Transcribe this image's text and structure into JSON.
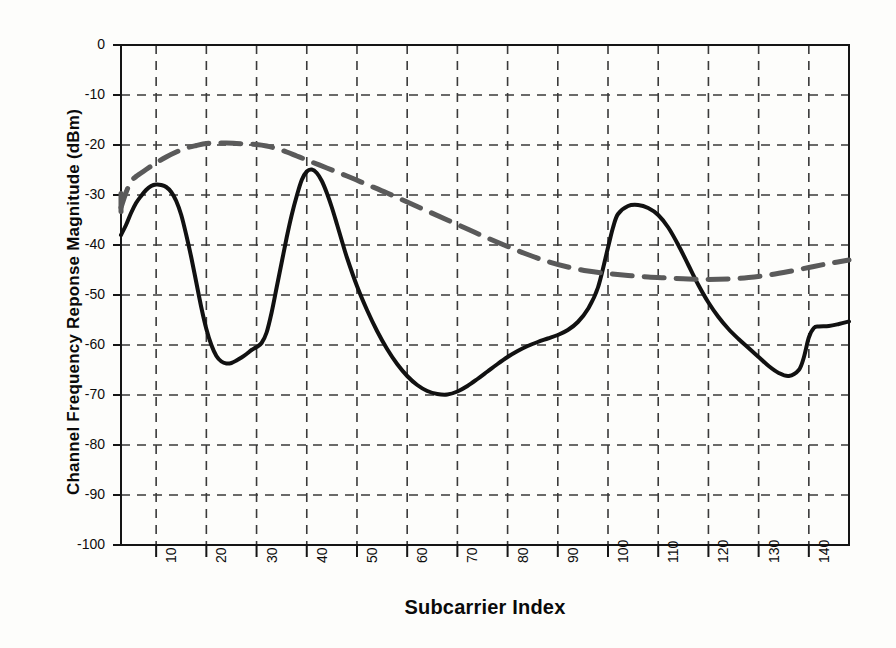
{
  "chart_data": {
    "type": "line",
    "title": "",
    "xlabel": "Subcarrier Index",
    "ylabel": "Channel Frequency Reponse Magnitude (dBm)",
    "xlim": [
      3,
      148
    ],
    "ylim": [
      -100,
      0
    ],
    "xticks": [
      10,
      20,
      30,
      40,
      50,
      60,
      70,
      80,
      90,
      100,
      110,
      120,
      130,
      140
    ],
    "yticks": [
      0,
      -10,
      -20,
      -30,
      -40,
      -50,
      -60,
      -70,
      -80,
      -90,
      -100
    ],
    "xtick_labels": [
      "10",
      "20",
      "30",
      "40",
      "50",
      "60",
      "70",
      "80",
      "90",
      "100",
      "110",
      "120",
      "130",
      "140"
    ],
    "ytick_labels": [
      "0",
      "-10",
      "-20",
      "-30",
      "-40",
      "-50",
      "-60",
      "-70",
      "-80",
      "-90",
      "-100"
    ],
    "grid": true,
    "grid_style": "dashed",
    "grid_color": "#3a3a3a",
    "legend": "none",
    "series": [
      {
        "name": "measured-channel-response",
        "style": "solid",
        "color": "#111111",
        "width": 4,
        "x": [
          3,
          4,
          5,
          6,
          7,
          8,
          9,
          10,
          11,
          12,
          13,
          14,
          15,
          16,
          17,
          18,
          19,
          20,
          21,
          22,
          23,
          24,
          25,
          26,
          27,
          28,
          29,
          30,
          31,
          32,
          33,
          34,
          35,
          36,
          37,
          38,
          39,
          40,
          41,
          42,
          43,
          44,
          45,
          46,
          47,
          48,
          50,
          52,
          54,
          56,
          58,
          60,
          62,
          64,
          66,
          68,
          70,
          72,
          74,
          76,
          78,
          80,
          82,
          84,
          86,
          88,
          90,
          92,
          94,
          96,
          98,
          100,
          101,
          102,
          104,
          106,
          108,
          110,
          112,
          114,
          116,
          118,
          120,
          122,
          124,
          126,
          128,
          130,
          132,
          134,
          136,
          138,
          139,
          140,
          141,
          142,
          144,
          146,
          148
        ],
        "y": [
          -38.0,
          -36.0,
          -33.6,
          -31.6,
          -30.2,
          -29.0,
          -28.2,
          -27.9,
          -28.0,
          -28.4,
          -29.4,
          -31.2,
          -34.0,
          -38.0,
          -42.5,
          -47.5,
          -52.5,
          -56.8,
          -60.0,
          -62.2,
          -63.3,
          -63.7,
          -63.6,
          -63.1,
          -62.5,
          -61.8,
          -61.0,
          -60.4,
          -59.6,
          -57.5,
          -53.5,
          -48.5,
          -43.5,
          -38.5,
          -34.0,
          -30.2,
          -27.0,
          -25.3,
          -24.9,
          -25.6,
          -27.2,
          -29.6,
          -32.5,
          -35.8,
          -39.2,
          -42.5,
          -48.2,
          -53.0,
          -57.2,
          -60.8,
          -63.8,
          -66.2,
          -68.0,
          -69.2,
          -69.8,
          -69.9,
          -69.3,
          -68.2,
          -66.8,
          -65.3,
          -63.8,
          -62.4,
          -61.2,
          -60.2,
          -59.4,
          -58.7,
          -58.0,
          -57.0,
          -55.4,
          -52.8,
          -48.5,
          -40.5,
          -36.5,
          -33.8,
          -32.2,
          -32.0,
          -32.6,
          -34.0,
          -36.5,
          -40.0,
          -44.0,
          -48.0,
          -51.5,
          -54.4,
          -56.8,
          -58.8,
          -60.6,
          -62.4,
          -64.2,
          -65.6,
          -66.2,
          -65.0,
          -62.5,
          -58.5,
          -56.6,
          -56.3,
          -56.2,
          -55.8,
          -55.3
        ]
      },
      {
        "name": "smoothed-channel-envelope",
        "style": "dashed",
        "color": "#5a5a5a",
        "width": 5,
        "x": [
          3,
          4,
          5,
          6,
          7,
          8,
          10,
          12,
          14,
          16,
          18,
          20,
          22,
          24,
          26,
          28,
          30,
          32,
          34,
          36,
          38,
          40,
          44,
          48,
          52,
          56,
          60,
          64,
          68,
          72,
          76,
          80,
          84,
          88,
          92,
          96,
          100,
          104,
          108,
          112,
          116,
          120,
          124,
          128,
          132,
          136,
          140,
          144,
          148
        ],
        "y": [
          -32.5,
          -29.5,
          -27.3,
          -26.3,
          -25.6,
          -24.9,
          -23.6,
          -22.4,
          -21.4,
          -20.6,
          -20.1,
          -19.7,
          -19.6,
          -19.6,
          -19.7,
          -19.8,
          -19.9,
          -20.2,
          -20.7,
          -21.4,
          -22.2,
          -23.0,
          -24.6,
          -26.2,
          -27.9,
          -29.6,
          -31.4,
          -33.2,
          -35.0,
          -36.8,
          -38.6,
          -40.3,
          -41.9,
          -43.3,
          -44.4,
          -45.2,
          -45.7,
          -46.1,
          -46.4,
          -46.6,
          -46.8,
          -46.9,
          -46.8,
          -46.5,
          -46.0,
          -45.3,
          -44.5,
          -43.7,
          -43.0
        ]
      }
    ]
  },
  "axes": {
    "x_title": "Subcarrier Index",
    "y_title": "Channel Frequency Reponse Magnitude (dBm)"
  },
  "colors": {
    "background": "#fdfdfb",
    "frame": "#151515",
    "grid": "#3a3a3a",
    "solid_series": "#111111",
    "dashed_series": "#5a5a5a"
  }
}
